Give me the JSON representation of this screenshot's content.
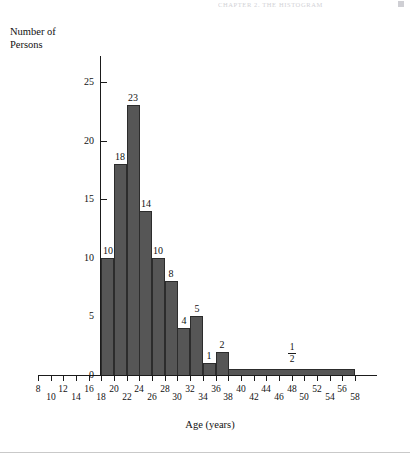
{
  "page": {
    "running_header": "CHAPTER 2.  THE HISTOGRAM",
    "background_color": "#ffffff"
  },
  "chart_data": {
    "type": "bar",
    "title": "",
    "subtitle": "",
    "xlabel": "Age (years)",
    "ylabel": "Number of\nPersons",
    "ylabel_line1": "Number of",
    "ylabel_line2": "Persons",
    "xlim": [
      8,
      58
    ],
    "ylim": [
      0,
      26
    ],
    "grid": false,
    "legend": null,
    "bar_color": "#565656",
    "bar_edge_color": "#2c2c2c",
    "axis_color": "#1b1b1b",
    "x_ticks": [
      8,
      10,
      12,
      14,
      16,
      18,
      20,
      22,
      24,
      26,
      28,
      30,
      32,
      34,
      36,
      38,
      40,
      42,
      44,
      46,
      48,
      50,
      52,
      54,
      56,
      58
    ],
    "y_ticks": [
      0,
      5,
      10,
      15,
      20,
      25
    ],
    "note": "Bars are drawn on class intervals of age; the last class 38-58 is 20 years wide and is drawn at height one-half.",
    "bars": [
      {
        "x_start": 18,
        "x_end": 20,
        "height": 10,
        "label": "10",
        "label_kind": "number"
      },
      {
        "x_start": 20,
        "x_end": 22,
        "height": 18,
        "label": "18",
        "label_kind": "number"
      },
      {
        "x_start": 22,
        "x_end": 24,
        "height": 23,
        "label": "23",
        "label_kind": "number"
      },
      {
        "x_start": 24,
        "x_end": 26,
        "height": 14,
        "label": "14",
        "label_kind": "number"
      },
      {
        "x_start": 26,
        "x_end": 28,
        "height": 10,
        "label": "10",
        "label_kind": "number"
      },
      {
        "x_start": 28,
        "x_end": 30,
        "height": 8,
        "label": "8",
        "label_kind": "number"
      },
      {
        "x_start": 30,
        "x_end": 32,
        "height": 4,
        "label": "4",
        "label_kind": "number"
      },
      {
        "x_start": 32,
        "x_end": 34,
        "height": 5,
        "label": "5",
        "label_kind": "number"
      },
      {
        "x_start": 34,
        "x_end": 36,
        "height": 1,
        "label": "1",
        "label_kind": "number"
      },
      {
        "x_start": 36,
        "x_end": 38,
        "height": 2,
        "label": "2",
        "label_kind": "number"
      },
      {
        "x_start": 38,
        "x_end": 58,
        "height": 0.5,
        "label": "1/2",
        "label_numerator": "1",
        "label_denominator": "2",
        "label_kind": "fraction"
      }
    ]
  }
}
